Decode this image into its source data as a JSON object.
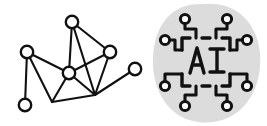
{
  "canvas": {
    "width": 267,
    "height": 126,
    "background_color": "#ffffff",
    "title": "network graph and AI chip illustration"
  },
  "palette": {
    "ink": "#111111",
    "paper": "#ffffff",
    "blob_gray": "#dcdcdc"
  },
  "left_illustration": {
    "name": "network-graph",
    "description": "hand-drawn node-link network diagram",
    "node_radius": 6.2,
    "nodes": [
      {
        "id": "n-top",
        "label": "top node",
        "cx": 72,
        "cy": 22,
        "has_circle": true
      },
      {
        "id": "n-left",
        "label": "left node",
        "cx": 27,
        "cy": 52,
        "has_circle": true
      },
      {
        "id": "n-right-upper",
        "label": "right upper node",
        "cx": 110,
        "cy": 52,
        "has_circle": true
      },
      {
        "id": "n-center",
        "label": "center hub node",
        "cx": 69,
        "cy": 73,
        "has_circle": true
      },
      {
        "id": "n-far-right",
        "label": "far right node",
        "cx": 135,
        "cy": 69,
        "has_circle": true
      },
      {
        "id": "n-bottom-left",
        "label": "bottom left node",
        "cx": 25,
        "cy": 105,
        "has_circle": true
      },
      {
        "id": "j-bottom-mid",
        "label": "bottom mid vertex",
        "cx": 95,
        "cy": 95,
        "has_circle": false
      },
      {
        "id": "j-bottom-low",
        "label": "lower left vertex",
        "cx": 52,
        "cy": 102,
        "has_circle": false
      }
    ],
    "edges": [
      {
        "from": "n-top",
        "to": "n-center"
      },
      {
        "from": "n-top",
        "to": "n-right-upper"
      },
      {
        "from": "n-top",
        "to": "j-bottom-mid"
      },
      {
        "from": "n-left",
        "to": "n-center"
      },
      {
        "from": "n-left",
        "to": "n-bottom-left"
      },
      {
        "from": "n-left",
        "to": "j-bottom-low"
      },
      {
        "from": "n-center",
        "to": "n-right-upper"
      },
      {
        "from": "n-center",
        "to": "j-bottom-mid"
      },
      {
        "from": "n-center",
        "to": "j-bottom-low"
      },
      {
        "from": "n-right-upper",
        "to": "j-bottom-mid"
      },
      {
        "from": "n-far-right",
        "to": "j-bottom-mid"
      },
      {
        "from": "j-bottom-low",
        "to": "j-bottom-mid"
      }
    ]
  },
  "right_illustration": {
    "name": "ai-chip-icon",
    "description": "AI microchip circuit icon on a soft gray blob",
    "blob": {
      "fill": "#dcdcdc",
      "center_x": 206,
      "center_y": 62
    },
    "chip_label": "AI",
    "chip_frame": {
      "x": 180,
      "y": 36,
      "width": 52,
      "height": 52,
      "corner_gap": true
    },
    "pads": [
      {
        "id": "pad-top-left",
        "cx": 185,
        "cy": 19
      },
      {
        "id": "pad-top-right",
        "cx": 227,
        "cy": 19
      },
      {
        "id": "pad-left-upper",
        "cx": 165,
        "cy": 40
      },
      {
        "id": "pad-right-upper",
        "cx": 247,
        "cy": 40
      },
      {
        "id": "pad-left-lower",
        "cx": 165,
        "cy": 86
      },
      {
        "id": "pad-right-lower",
        "cx": 247,
        "cy": 86
      },
      {
        "id": "pad-bottom-left",
        "cx": 185,
        "cy": 106
      },
      {
        "id": "pad-bottom-right",
        "cx": 227,
        "cy": 106
      }
    ],
    "trace_count": 8
  }
}
